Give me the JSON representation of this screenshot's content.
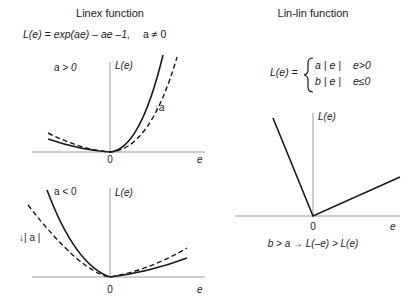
{
  "left_panel": {
    "title": "Linex function",
    "formula_lhs": "L(e) = exp(ae) – ae –1,",
    "formula_condition": "a ≠ 0",
    "top_plot": {
      "case_label": "a > 0",
      "y_axis_label": "L(e)",
      "x_axis_label": "e",
      "origin_label": "0",
      "annotation": "↓a"
    },
    "bottom_plot": {
      "case_label": "a < 0",
      "y_axis_label": "L(e)",
      "x_axis_label": "e",
      "origin_label": "0",
      "annotation": "↓| a |"
    }
  },
  "right_panel": {
    "title": "Lin-lin function",
    "formula_lhs": "L(e) =",
    "case1_expr": "a | e |",
    "case1_cond": "e>0",
    "case2_expr": "b | e |",
    "case2_cond": "e≤0",
    "plot": {
      "y_axis_label": "L(e)",
      "x_axis_label": "e",
      "origin_label": "0"
    },
    "caption": "b > a → L(–e) > L(e)"
  },
  "colors": {
    "axis": "#9a9a9a",
    "curve": "#1a1a1a",
    "text": "#1a1a1a"
  }
}
